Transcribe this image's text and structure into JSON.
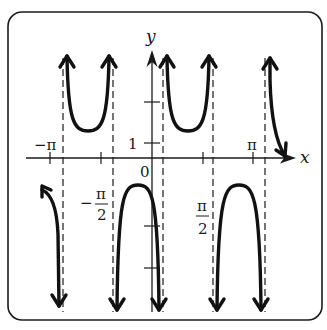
{
  "chart_data": {
    "type": "line",
    "title": "",
    "function": "y = sec(2x) (graph of secant-type curve with period pi)",
    "xlabel": "x",
    "ylabel": "y",
    "x_tick_labels": [
      "-π",
      "-π/2",
      "0",
      "π/2",
      "π"
    ],
    "x_ticks": [
      -3.1416,
      -1.5708,
      0,
      1.5708,
      3.1416
    ],
    "y_tick_labels": [
      "1"
    ],
    "y_ticks": [
      1,
      2,
      -1,
      -2
    ],
    "asymptotes_x": [
      -2.3562,
      -0.7854,
      0.7854,
      2.3562,
      3.927
    ],
    "xlim": [
      -4.0,
      4.6
    ],
    "ylim": [
      -3.5,
      3.6
    ],
    "grid": false,
    "legend": null,
    "branches": [
      {
        "x_range": [
          -3.92,
          -2.36
        ],
        "direction": "down",
        "note": "left partial branch, rises toward y≈-1 at x=-π then falls to -∞"
      },
      {
        "x_range": [
          -2.36,
          -0.79
        ],
        "direction": "up",
        "vertex": [
          -1.5708,
          1
        ]
      },
      {
        "x_range": [
          -0.79,
          0.79
        ],
        "direction": "down",
        "vertex": [
          0,
          -1
        ]
      },
      {
        "x_range": [
          0.79,
          2.36
        ],
        "direction": "up",
        "vertex": [
          1.5708,
          1
        ]
      },
      {
        "x_range": [
          2.36,
          3.93
        ],
        "direction": "down",
        "vertex": [
          3.1416,
          -1
        ]
      },
      {
        "x_range": [
          3.93,
          4.4
        ],
        "direction": "up",
        "note": "right partial branch, descends from +∞"
      }
    ]
  },
  "labels": {
    "x_axis": "x",
    "y_axis": "y",
    "origin": "0",
    "neg_pi": "−π",
    "pi": "π",
    "neg_pi_half_sign": "−",
    "pi_sym": "π",
    "two": "2",
    "one": "1"
  },
  "colors": {
    "ink": "#111111",
    "background": "#ffffff"
  }
}
